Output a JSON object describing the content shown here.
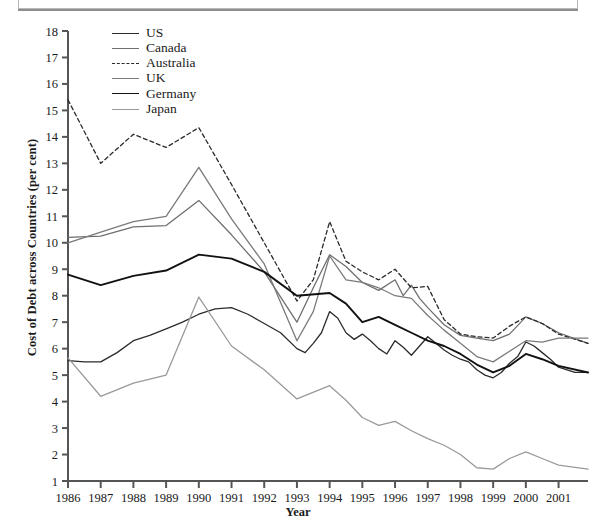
{
  "caption": {
    "text_faded": "",
    "visible": true
  },
  "chart_data": {
    "type": "line",
    "title": "",
    "xlabel": "Year",
    "ylabel": "Cost of Debt across Countries (per cent)",
    "xlim": [
      1986,
      2001.9
    ],
    "ylim": [
      1,
      18
    ],
    "yticks": [
      1,
      2,
      3,
      4,
      5,
      6,
      7,
      8,
      9,
      10,
      11,
      12,
      13,
      14,
      15,
      16,
      17,
      18
    ],
    "xticks": [
      "1986",
      "1987",
      "1988",
      "1989",
      "1990",
      "1991",
      "1992",
      "1993",
      "1994",
      "1995",
      "1996",
      "1997",
      "1998",
      "1999",
      "2000",
      "2001"
    ],
    "grid": false,
    "legend_position": "top-left",
    "series": [
      {
        "name": "US",
        "color": "#2b2b2b",
        "width": 1.3,
        "dash": "none",
        "x": [
          1986,
          1986.5,
          1987,
          1987.5,
          1988,
          1988.5,
          1989,
          1989.5,
          1990,
          1990.5,
          1991,
          1991.5,
          1992,
          1992.5,
          1993,
          1993.25,
          1993.5,
          1993.75,
          1994,
          1994.25,
          1994.5,
          1994.75,
          1995,
          1995.25,
          1995.5,
          1995.75,
          1996,
          1996.25,
          1996.5,
          1996.75,
          1997,
          1997.25,
          1997.5,
          1997.75,
          1998,
          1998.25,
          1998.5,
          1998.75,
          1999,
          1999.25,
          1999.5,
          1999.75,
          2000,
          2000.25,
          2000.5,
          2000.75,
          2001,
          2001.5,
          2001.9
        ],
        "values": [
          5.55,
          5.5,
          5.5,
          5.85,
          6.3,
          6.5,
          6.75,
          7.0,
          7.3,
          7.5,
          7.55,
          7.3,
          6.95,
          6.6,
          6.0,
          5.85,
          6.2,
          6.6,
          7.4,
          7.15,
          6.6,
          6.35,
          6.55,
          6.3,
          6.0,
          5.8,
          6.3,
          6.05,
          5.75,
          6.1,
          6.45,
          6.2,
          5.95,
          5.75,
          5.6,
          5.5,
          5.2,
          5.0,
          4.9,
          5.1,
          5.45,
          5.7,
          6.25,
          6.1,
          5.85,
          5.6,
          5.3,
          5.1,
          5.1
        ]
      },
      {
        "name": "Canada",
        "color": "#6f6f6f",
        "width": 1.3,
        "dash": "none",
        "x": [
          1986,
          1987,
          1988,
          1989,
          1990,
          1991,
          1992,
          1993,
          1993.5,
          1994,
          1994.5,
          1995,
          1995.5,
          1996,
          1996.25,
          1996.5,
          1996.75,
          1997,
          1997.5,
          1998,
          1998.5,
          1999,
          1999.5,
          2000,
          2000.5,
          2001,
          2001.9
        ],
        "values": [
          10.2,
          10.25,
          10.6,
          10.65,
          11.6,
          10.3,
          8.9,
          7.0,
          8.3,
          9.55,
          9.1,
          8.5,
          8.2,
          8.6,
          8.0,
          8.4,
          7.9,
          7.55,
          6.9,
          6.5,
          6.4,
          6.3,
          6.55,
          7.2,
          6.95,
          6.6,
          6.2
        ]
      },
      {
        "name": "Australia",
        "color": "#2b2b2b",
        "width": 1.3,
        "dash": "4,3",
        "x": [
          1986,
          1987,
          1988,
          1989,
          1990,
          1991,
          1992,
          1993,
          1993.5,
          1994,
          1994.5,
          1995,
          1995.5,
          1996,
          1996.5,
          1997,
          1997.5,
          1998,
          1998.5,
          1999,
          1999.5,
          2000,
          2000.5,
          2001,
          2001.9
        ],
        "values": [
          15.4,
          13.0,
          14.1,
          13.6,
          14.35,
          12.2,
          10.0,
          7.8,
          8.6,
          10.8,
          9.3,
          8.9,
          8.6,
          9.0,
          8.3,
          8.35,
          7.1,
          6.55,
          6.45,
          6.4,
          6.85,
          7.2,
          6.95,
          6.55,
          6.2
        ]
      },
      {
        "name": "UK",
        "color": "#7a7a7a",
        "width": 1.3,
        "dash": "none",
        "x": [
          1986,
          1987,
          1988,
          1989,
          1990,
          1991,
          1992,
          1993,
          1993.5,
          1994,
          1994.5,
          1995,
          1995.5,
          1996,
          1996.5,
          1997,
          1997.5,
          1998,
          1998.5,
          1999,
          1999.5,
          2000,
          2000.5,
          2001,
          2001.9
        ],
        "values": [
          10.0,
          10.4,
          10.8,
          11.0,
          12.85,
          10.9,
          9.2,
          6.3,
          7.4,
          9.5,
          8.6,
          8.5,
          8.3,
          8.0,
          7.9,
          7.25,
          6.7,
          6.2,
          5.7,
          5.5,
          5.9,
          6.3,
          6.25,
          6.4,
          6.4
        ]
      },
      {
        "name": "Germany",
        "color": "#111111",
        "width": 1.9,
        "dash": "none",
        "x": [
          1986,
          1987,
          1988,
          1989,
          1990,
          1991,
          1992,
          1993,
          1994,
          1994.5,
          1995,
          1995.5,
          1996,
          1996.5,
          1997,
          1997.5,
          1998,
          1998.5,
          1999,
          1999.5,
          2000,
          2000.5,
          2001,
          2001.9
        ],
        "values": [
          8.8,
          8.4,
          8.75,
          8.95,
          9.55,
          9.4,
          8.9,
          8.0,
          8.1,
          7.7,
          7.0,
          7.2,
          6.9,
          6.6,
          6.3,
          6.1,
          5.8,
          5.4,
          5.1,
          5.35,
          5.8,
          5.6,
          5.35,
          5.1
        ]
      },
      {
        "name": "Japan",
        "color": "#9a9a9a",
        "width": 1.3,
        "dash": "none",
        "x": [
          1986,
          1987,
          1988,
          1989,
          1990,
          1991,
          1992,
          1993,
          1994,
          1994.5,
          1995,
          1995.5,
          1996,
          1996.5,
          1997,
          1997.5,
          1998,
          1998.5,
          1999,
          1999.5,
          2000,
          2000.5,
          2001,
          2001.9
        ],
        "values": [
          5.65,
          4.2,
          4.7,
          5.0,
          7.95,
          6.1,
          5.2,
          4.1,
          4.6,
          4.05,
          3.4,
          3.1,
          3.25,
          2.9,
          2.6,
          2.35,
          2.0,
          1.5,
          1.45,
          1.85,
          2.1,
          1.85,
          1.6,
          1.45
        ]
      }
    ]
  },
  "legend": {
    "items": [
      {
        "label": "US"
      },
      {
        "label": "Canada"
      },
      {
        "label": "Australia"
      },
      {
        "label": "UK"
      },
      {
        "label": "Germany"
      },
      {
        "label": "Japan"
      }
    ]
  }
}
